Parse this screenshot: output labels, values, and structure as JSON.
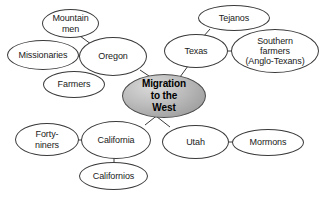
{
  "diagram": {
    "type": "concept-web",
    "background_color": "#ffffff",
    "node_border_color": "#3a3a3a",
    "center_fill_color": "#bdbdbd",
    "center": {
      "id": "center",
      "label": "Migration to the West",
      "lines": [
        "Migration",
        "to the",
        "West"
      ],
      "x": 122,
      "y": 74,
      "w": 84,
      "h": 44
    },
    "nodes": [
      {
        "id": "mountain-men",
        "label": "Mountain men",
        "lines": [
          "Mountain",
          "men"
        ],
        "x": 42,
        "y": 9,
        "w": 57,
        "h": 29
      },
      {
        "id": "missionaries",
        "label": "Missionaries",
        "lines": [
          "Missionaries"
        ],
        "x": 7,
        "y": 40,
        "w": 72,
        "h": 30
      },
      {
        "id": "oregon",
        "label": "Oregon",
        "lines": [
          "Oregon"
        ],
        "x": 79,
        "y": 37,
        "w": 68,
        "h": 39
      },
      {
        "id": "farmers",
        "label": "Farmers",
        "lines": [
          "Farmers"
        ],
        "x": 43,
        "y": 71,
        "w": 62,
        "h": 27
      },
      {
        "id": "tejanos",
        "label": "Tejanos",
        "lines": [
          "Tejanos"
        ],
        "x": 198,
        "y": 5,
        "w": 72,
        "h": 26
      },
      {
        "id": "texas",
        "label": "Texas",
        "lines": [
          "Texas"
        ],
        "x": 164,
        "y": 34,
        "w": 64,
        "h": 34
      },
      {
        "id": "southern-farmers",
        "label": "Southern farmers (Anglo-Texans)",
        "lines": [
          "Southern",
          "farmers",
          "(Anglo-Texans)"
        ],
        "x": 231,
        "y": 29,
        "w": 88,
        "h": 44
      },
      {
        "id": "forty-niners",
        "label": "Forty-niners",
        "lines": [
          "Forty-",
          "niners"
        ],
        "x": 15,
        "y": 123,
        "w": 64,
        "h": 33
      },
      {
        "id": "california",
        "label": "California",
        "lines": [
          "California"
        ],
        "x": 81,
        "y": 121,
        "w": 70,
        "h": 38
      },
      {
        "id": "californios",
        "label": "Californios",
        "lines": [
          "Californios"
        ],
        "x": 79,
        "y": 162,
        "w": 69,
        "h": 28
      },
      {
        "id": "utah",
        "label": "Utah",
        "lines": [
          "Utah"
        ],
        "x": 162,
        "y": 125,
        "w": 67,
        "h": 34
      },
      {
        "id": "mormons",
        "label": "Mormons",
        "lines": [
          "Mormons"
        ],
        "x": 232,
        "y": 129,
        "w": 72,
        "h": 27
      }
    ],
    "links": [
      {
        "from": "oregon",
        "to": "center",
        "x1": 140,
        "y1": 70,
        "x2": 152,
        "y2": 78
      },
      {
        "from": "texas",
        "to": "center",
        "x1": 188,
        "y1": 66,
        "x2": 180,
        "y2": 77
      },
      {
        "from": "utah",
        "to": "center",
        "x1": 152,
        "y1": 113,
        "x2": 170,
        "y2": 127
      },
      {
        "from": "california",
        "to": "center",
        "x1": 145,
        "y1": 125,
        "x2": 159,
        "y2": 114
      },
      {
        "from": "mountain-men",
        "to": "oregon",
        "x1": 80,
        "y1": 36,
        "x2": 95,
        "y2": 47
      },
      {
        "from": "missionaries",
        "to": "oregon",
        "x1": 78,
        "y1": 56,
        "x2": 86,
        "y2": 56
      },
      {
        "from": "farmers",
        "to": "oregon",
        "x1": 94,
        "y1": 72,
        "x2": 101,
        "y2": 65
      },
      {
        "from": "tejanos",
        "to": "texas",
        "x1": 210,
        "y1": 29,
        "x2": 203,
        "y2": 37
      },
      {
        "from": "southern-farmers",
        "to": "texas",
        "x1": 227,
        "y1": 51,
        "x2": 234,
        "y2": 51
      },
      {
        "from": "forty-niners",
        "to": "california",
        "x1": 78,
        "y1": 140,
        "x2": 86,
        "y2": 140
      },
      {
        "from": "californios",
        "to": "california",
        "x1": 114,
        "y1": 158,
        "x2": 114,
        "y2": 164
      },
      {
        "from": "mormons",
        "to": "utah",
        "x1": 228,
        "y1": 142,
        "x2": 235,
        "y2": 142
      }
    ]
  }
}
